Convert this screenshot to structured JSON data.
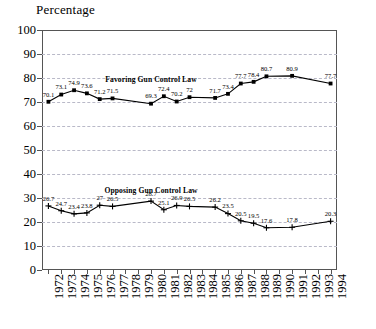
{
  "chart_data": {
    "type": "line",
    "title": "",
    "ylabel": "Percentage",
    "xlabel": "",
    "ylim": [
      0,
      100
    ],
    "ytick_step": 10,
    "yticks": [
      0,
      10,
      20,
      30,
      40,
      50,
      60,
      70,
      80,
      90,
      100
    ],
    "grid": "horizontal-dashed",
    "legend": "inline-annotation",
    "categories": [
      "1972",
      "1973",
      "1974",
      "1975",
      "1976",
      "1977",
      "1978",
      "1979",
      "1980",
      "1981",
      "1982",
      "1983",
      "1984",
      "1985",
      "1986",
      "1987",
      "1988",
      "1989",
      "1990",
      "1991",
      "1992",
      "1993",
      "1994"
    ],
    "series": [
      {
        "name": "Favoring Gun Control Law",
        "marker": "square",
        "color": "#000000",
        "label_anchor_x": "1980",
        "label_anchor_y": 79.5,
        "points": [
          {
            "x": "1972",
            "y": 70.1,
            "label": "70.1"
          },
          {
            "x": "1973",
            "y": 73.1,
            "label": "73.1"
          },
          {
            "x": "1974",
            "y": 74.9,
            "label": "74.9"
          },
          {
            "x": "1975",
            "y": 73.6,
            "label": "73.6"
          },
          {
            "x": "1976",
            "y": 71.2,
            "label": "71.2"
          },
          {
            "x": "1977",
            "y": 71.5,
            "label": "71.5"
          },
          {
            "x": "1978",
            "y": null,
            "label": ""
          },
          {
            "x": "1979",
            "y": null,
            "label": ""
          },
          {
            "x": "1980",
            "y": 69.3,
            "label": "69.3"
          },
          {
            "x": "1981",
            "y": 72.4,
            "label": "72.4"
          },
          {
            "x": "1982",
            "y": 70.2,
            "label": "70.2"
          },
          {
            "x": "1983",
            "y": 72.0,
            "label": "72"
          },
          {
            "x": "1984",
            "y": null,
            "label": ""
          },
          {
            "x": "1985",
            "y": 71.7,
            "label": "71.7"
          },
          {
            "x": "1986",
            "y": 73.4,
            "label": "73.4"
          },
          {
            "x": "1987",
            "y": 77.7,
            "label": "77.7"
          },
          {
            "x": "1988",
            "y": 78.4,
            "label": "78.4"
          },
          {
            "x": "1989",
            "y": 80.7,
            "label": "80.7"
          },
          {
            "x": "1990",
            "y": null,
            "label": ""
          },
          {
            "x": "1991",
            "y": 80.9,
            "label": "80.9"
          },
          {
            "x": "1992",
            "y": null,
            "label": ""
          },
          {
            "x": "1993",
            "y": null,
            "label": ""
          },
          {
            "x": "1994",
            "y": 77.7,
            "label": "77.7"
          }
        ]
      },
      {
        "name": "Opposing Gun Control Law",
        "marker": "plus",
        "color": "#000000",
        "label_anchor_x": "1980",
        "label_anchor_y": 33.5,
        "points": [
          {
            "x": "1972",
            "y": 26.7,
            "label": "26.7"
          },
          {
            "x": "1973",
            "y": 24.7,
            "label": "24.7"
          },
          {
            "x": "1974",
            "y": 23.4,
            "label": "23.4"
          },
          {
            "x": "1975",
            "y": 23.8,
            "label": "23.8"
          },
          {
            "x": "1976",
            "y": 27.0,
            "label": "27"
          },
          {
            "x": "1977",
            "y": 26.5,
            "label": "26.5"
          },
          {
            "x": "1978",
            "y": null,
            "label": ""
          },
          {
            "x": "1979",
            "y": null,
            "label": ""
          },
          {
            "x": "1980",
            "y": 28.7,
            "label": "28.7"
          },
          {
            "x": "1981",
            "y": 25.1,
            "label": "25.1"
          },
          {
            "x": "1982",
            "y": 26.9,
            "label": "26.9"
          },
          {
            "x": "1983",
            "y": 26.5,
            "label": "26.5"
          },
          {
            "x": "1984",
            "y": null,
            "label": ""
          },
          {
            "x": "1985",
            "y": 26.2,
            "label": "26.2"
          },
          {
            "x": "1986",
            "y": 23.5,
            "label": "23.5"
          },
          {
            "x": "1987",
            "y": 20.5,
            "label": "20.5"
          },
          {
            "x": "1988",
            "y": 19.5,
            "label": "19.5"
          },
          {
            "x": "1989",
            "y": 17.6,
            "label": "17.6"
          },
          {
            "x": "1990",
            "y": null,
            "label": ""
          },
          {
            "x": "1991",
            "y": 17.8,
            "label": "17.8"
          },
          {
            "x": "1992",
            "y": null,
            "label": ""
          },
          {
            "x": "1993",
            "y": null,
            "label": ""
          },
          {
            "x": "1994",
            "y": 20.3,
            "label": "20.3"
          }
        ]
      }
    ]
  }
}
